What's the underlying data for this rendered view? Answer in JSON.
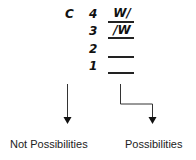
{
  "diagram": {
    "letter": "C",
    "slots": [
      {
        "number": "4",
        "value": "W/"
      },
      {
        "number": "3",
        "value": "/W"
      },
      {
        "number": "2",
        "value": ""
      },
      {
        "number": "1",
        "value": ""
      }
    ],
    "labels": {
      "left": "Not Possibilities",
      "right": "Possibilities"
    }
  }
}
